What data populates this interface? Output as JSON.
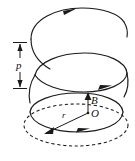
{
  "figure": {
    "background_color": "#ffffff",
    "line_color": "#1a1a1a",
    "labels": {
      "pitch": "p",
      "field": "B",
      "origin": "O",
      "radius": "r"
    },
    "elements": {
      "helix_name": "helical path",
      "pitch_dimension_name": "pitch dimension line",
      "field_vector_name": "magnetic field vector",
      "radius_line_name": "radius line",
      "base_circle_name": "base circle",
      "projection_circle_name": "dashed projection circle"
    },
    "turn_count": 3,
    "direction_marker_count": 4
  }
}
